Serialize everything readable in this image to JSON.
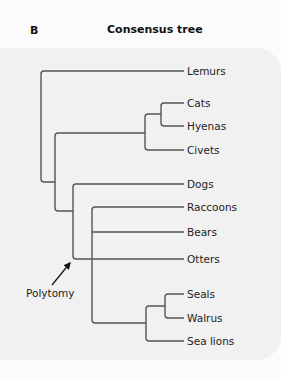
{
  "figure": {
    "panel_letter": "B",
    "title": "Consensus tree"
  },
  "tree": {
    "taxa": [
      "Lemurs",
      "Cats",
      "Hyenas",
      "Civets",
      "Dogs",
      "Raccoons",
      "Bears",
      "Otters",
      "Seals",
      "Walrus",
      "Sea lions"
    ],
    "newick": "(Lemurs,((Civets,(Cats,Hyenas)),(Dogs,Otters,(Raccoons,Bears,(Sea lions,(Seals,Walrus))))));",
    "annotation": {
      "label": "Polytomy",
      "points_to": "node joining Dogs, Otters and the Raccoons/Bears/pinniped clade"
    }
  },
  "colors": {
    "branch": "#555555",
    "panel_background": "#f1f1f1",
    "page_background": "#fbfbfb"
  }
}
